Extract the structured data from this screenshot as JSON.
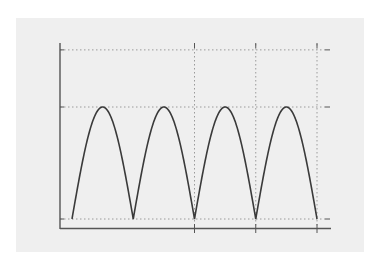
{
  "chart_data": {
    "type": "line",
    "title": "",
    "xlabel": "",
    "ylabel": "",
    "x": [
      0,
      0.125,
      0.25,
      0.375,
      0.5,
      0.625,
      0.75,
      0.875,
      1,
      1.125,
      1.25,
      1.375,
      1.5,
      1.625,
      1.75,
      1.875,
      2,
      2.125,
      2.25,
      2.375,
      2.5,
      2.625,
      2.75,
      2.875,
      3,
      3.125,
      3.25,
      3.375,
      3.5,
      3.625,
      3.75,
      3.875,
      4
    ],
    "series": [
      {
        "name": "|sin|",
        "values": [
          0,
          0.383,
          0.707,
          0.924,
          1,
          0.924,
          0.707,
          0.383,
          0,
          0.383,
          0.707,
          0.924,
          1,
          0.924,
          0.707,
          0.383,
          0,
          0.383,
          0.707,
          0.924,
          1,
          0.924,
          0.707,
          0.383,
          0,
          0.383,
          0.707,
          0.924,
          1,
          0.924,
          0.707,
          0.383,
          0
        ]
      }
    ],
    "xlim": [
      0,
      4
    ],
    "ylim": [
      0,
      1.5
    ],
    "horizontal_gridlines": [
      0,
      1,
      1.5
    ],
    "vertical_gridlines": [
      2,
      3,
      4
    ],
    "grid": true,
    "grid_style": "dotted",
    "legend": null,
    "tick_labels": "none"
  },
  "colors": {
    "background": "#efefef",
    "line": "#3a3a3a",
    "axis": "#555555",
    "grid": "#9a9a9a"
  }
}
